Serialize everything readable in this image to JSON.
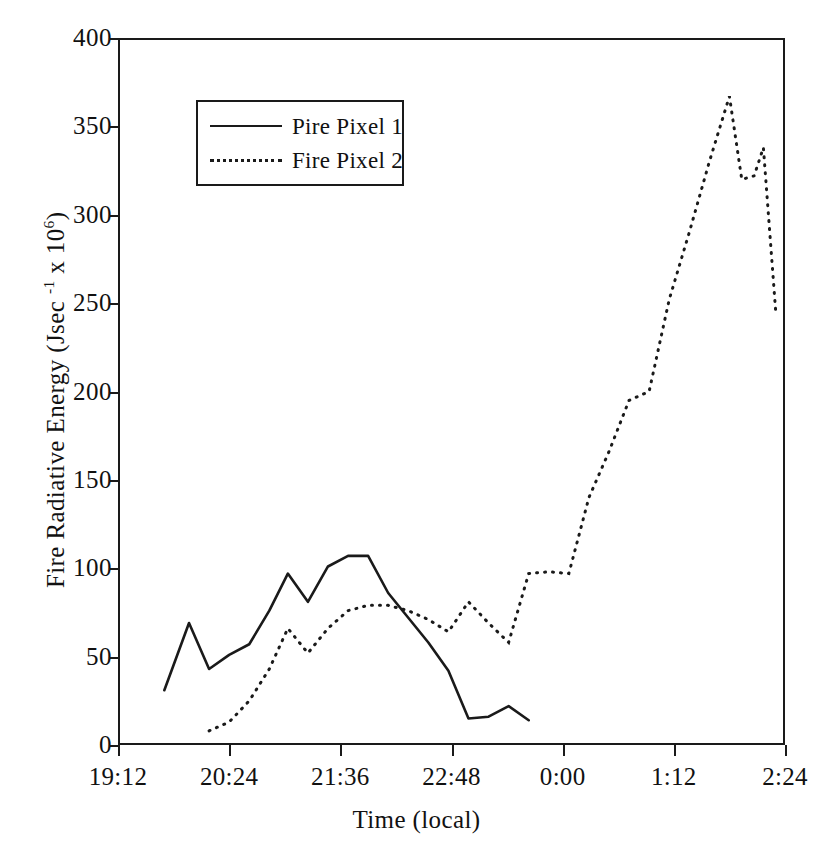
{
  "chart_data": {
    "type": "line",
    "title": "",
    "xlabel": "Time (local)",
    "ylabel": "Fire Radiative Energy (Jsec -1 x 10 6)",
    "ylabel_parts": {
      "prefix": "Fire Radiative Energy (Jsec ",
      "sup1": "-1",
      "middle": " x 10",
      "sup2": "6",
      "suffix": ")"
    },
    "xlim": [
      1152,
      1584
    ],
    "ylim": [
      0,
      400
    ],
    "grid": false,
    "legend_position": "upper-left-inside",
    "xtick_labels": [
      "19:12",
      "20:24",
      "21:36",
      "22:48",
      "0:00",
      "1:12",
      "2:24"
    ],
    "xtick_values": [
      1152,
      1224,
      1296,
      1368,
      1440,
      1512,
      1584
    ],
    "ytick_labels": [
      "0",
      "50",
      "100",
      "150",
      "200",
      "250",
      "300",
      "350",
      "400"
    ],
    "ytick_values": [
      0,
      50,
      100,
      150,
      200,
      250,
      300,
      350,
      400
    ],
    "series": [
      {
        "name": "Pire Pixel 1",
        "style": "solid",
        "color": "#1a1a1a",
        "x": [
          1182,
          1198,
          1211,
          1224,
          1237,
          1250,
          1262,
          1275,
          1288,
          1301,
          1314,
          1327,
          1340,
          1353,
          1366,
          1379,
          1392,
          1405,
          1418
        ],
        "y": [
          31,
          69,
          43,
          51,
          57,
          76,
          97,
          81,
          101,
          107,
          107,
          86,
          72,
          58,
          42,
          15,
          16,
          22,
          14
        ]
      },
      {
        "name": "Fire Pixel 2",
        "style": "dotted",
        "color": "#1a1a1a",
        "x": [
          1211,
          1224,
          1237,
          1250,
          1262,
          1275,
          1288,
          1301,
          1314,
          1327,
          1340,
          1353,
          1366,
          1379,
          1392,
          1405,
          1418,
          1431,
          1444,
          1457,
          1470,
          1483,
          1496,
          1509,
          1522,
          1535,
          1548
        ],
        "y": [
          8,
          13,
          25,
          43,
          66,
          52,
          66,
          76,
          79,
          79,
          76,
          71,
          64,
          81,
          69,
          58,
          97,
          98,
          97,
          140,
          166,
          195,
          200,
          252,
          290,
          330,
          367
        ]
      }
    ],
    "series_extra": [
      {
        "name": "Fire Pixel 2 tail",
        "x": [
          1548,
          1556,
          1564,
          1570,
          1578
        ],
        "y": [
          367,
          320,
          322,
          338,
          245
        ]
      }
    ]
  },
  "legend": {
    "items": [
      {
        "label": "Pire Pixel 1",
        "style": "solid"
      },
      {
        "label": "Fire Pixel 2",
        "style": "dotted"
      }
    ]
  },
  "axes": {
    "x_title": "Time (local)",
    "y_title_prefix": "Fire Radiative Energy (Jsec ",
    "y_title_sup1": "-1",
    "y_title_middle": " x 10",
    "y_title_sup2": "6",
    "y_title_suffix": ")"
  }
}
